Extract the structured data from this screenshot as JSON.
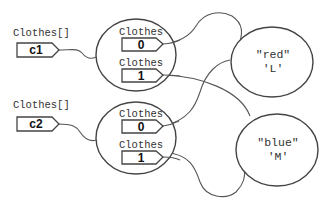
{
  "diagram": {
    "variables": [
      {
        "type_label": "Clothes[]",
        "name": "c1"
      },
      {
        "type_label": "Clothes[]",
        "name": "c2"
      }
    ],
    "arrays": [
      {
        "elements": [
          {
            "type_label": "Clothes",
            "index": "0"
          },
          {
            "type_label": "Clothes",
            "index": "1"
          }
        ]
      },
      {
        "elements": [
          {
            "type_label": "Clothes",
            "index": "0"
          },
          {
            "type_label": "Clothes",
            "index": "1"
          }
        ]
      }
    ],
    "objects": [
      {
        "line1": "\"red\"",
        "line2": "'L'"
      },
      {
        "line1": "\"blue\"",
        "line2": "'M'"
      }
    ]
  }
}
